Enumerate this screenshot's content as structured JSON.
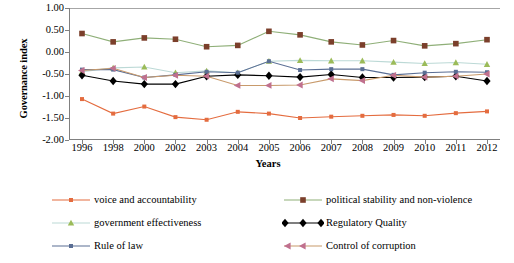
{
  "chart_data": {
    "type": "line",
    "title": "",
    "xlabel": "Years",
    "ylabel": "Governance index",
    "categories": [
      "1996",
      "1998",
      "2000",
      "2002",
      "2003",
      "2004",
      "2005",
      "2006",
      "2007",
      "2008",
      "2009",
      "2010",
      "2011",
      "2012"
    ],
    "ylim": [
      -2.0,
      1.0
    ],
    "ytick_labels": [
      "1.00",
      "0.50",
      "0.00",
      "-0.50",
      "-1.00",
      "-1.50",
      "-2.00"
    ],
    "ytick_values": [
      1.0,
      0.5,
      0.0,
      -0.5,
      -1.0,
      -1.5,
      -2.0
    ],
    "grid": false,
    "legend_position": "bottom",
    "series": [
      {
        "name": "voice and accountability",
        "color": "#E46C3F",
        "marker": "square-small",
        "values": [
          -1.07,
          -1.4,
          -1.24,
          -1.48,
          -1.54,
          -1.36,
          -1.4,
          -1.5,
          -1.47,
          -1.45,
          -1.43,
          -1.45,
          -1.39,
          -1.35
        ]
      },
      {
        "name": "political stability and non-violence",
        "color": "#7B3F2B",
        "line_color": "#8FAF78",
        "marker": "square",
        "values": [
          0.42,
          0.23,
          0.32,
          0.29,
          0.12,
          0.15,
          0.47,
          0.39,
          0.23,
          0.16,
          0.26,
          0.14,
          0.19,
          0.28
        ]
      },
      {
        "name": "government effectiveness",
        "color": "#9BBB59",
        "line_color": "#BCD9D6",
        "marker": "triangle",
        "values": [
          -0.45,
          -0.36,
          -0.34,
          -0.47,
          -0.43,
          -0.47,
          -0.21,
          -0.19,
          -0.2,
          -0.2,
          -0.23,
          -0.26,
          -0.24,
          -0.28
        ]
      },
      {
        "name": "Regulatory Quality",
        "color": "#000000",
        "marker": "diamond",
        "values": [
          -0.53,
          -0.66,
          -0.73,
          -0.73,
          -0.55,
          -0.52,
          -0.54,
          -0.57,
          -0.51,
          -0.58,
          -0.58,
          -0.57,
          -0.55,
          -0.66
        ]
      },
      {
        "name": "Rule of law",
        "color": "#5A6E94",
        "marker": "square-small",
        "values": [
          -0.4,
          -0.4,
          -0.58,
          -0.52,
          -0.45,
          -0.47,
          -0.21,
          -0.41,
          -0.39,
          -0.39,
          -0.52,
          -0.47,
          -0.45,
          -0.46
        ]
      },
      {
        "name": "Control of corruption",
        "color": "#C0708E",
        "line_color": "#C89A6B",
        "marker": "triangle-left",
        "values": [
          -0.42,
          -0.37,
          -0.58,
          -0.53,
          -0.55,
          -0.76,
          -0.76,
          -0.75,
          -0.61,
          -0.65,
          -0.53,
          -0.57,
          -0.55,
          -0.5
        ]
      }
    ]
  },
  "axes": {
    "y_title": "Governance index",
    "x_title": "Years"
  }
}
